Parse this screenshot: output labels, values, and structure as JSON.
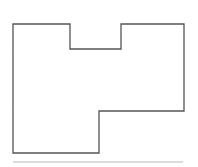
{
  "diagram": {
    "type": "floor-plan-outline",
    "outline": {
      "points": "13,24 70,24 70,49 121,49 121,24 184,24 184,111 99,111 99,153 13,153",
      "stroke": "#555555",
      "stroke_width": 1.3,
      "fill": "none"
    },
    "separator": {
      "x1": 13,
      "y1": 162,
      "x2": 183,
      "y2": 162,
      "stroke": "#d0d0d0",
      "stroke_width": 1.5
    }
  }
}
